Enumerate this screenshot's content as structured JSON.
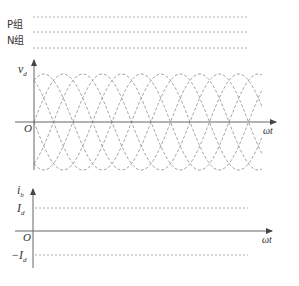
{
  "colors": {
    "axis": "#666666",
    "dash": "#9a9a9a",
    "wave": "#8a8a8a",
    "text": "#333333"
  },
  "top_section": {
    "labels": [
      {
        "text": "P组",
        "y": 28
      },
      {
        "text": "N组",
        "y": 44
      }
    ],
    "dashed_lines_y": [
      17,
      32,
      48
    ],
    "x_start": 33,
    "x_end": 248
  },
  "vd_plot": {
    "y_axis_label": "v",
    "y_axis_label_sub": "d",
    "origin_label": "O",
    "x_axis_label": "ωt",
    "origin": {
      "x": 34,
      "y": 122
    },
    "x_axis_end": 276,
    "y_axis_top": 60,
    "y_axis_bottom": 170,
    "wave_x_start": 34,
    "wave_x_end": 262,
    "amplitude": 48,
    "period_px": 117,
    "phases": 6
  },
  "ib_plot": {
    "y_axis_label": "i",
    "y_axis_label_sub": "b",
    "origin_label": "O",
    "x_axis_label": "ωt",
    "pos_level_label": "I",
    "pos_level_sub": "d",
    "neg_level_label": "−I",
    "neg_level_sub": "d",
    "origin": {
      "x": 33,
      "y": 231
    },
    "x_axis_end": 272,
    "y_axis_top": 189,
    "y_axis_bottom": 268,
    "pos_level_y": 208,
    "neg_level_y": 255,
    "level_x_start": 35,
    "level_x_end": 248
  }
}
